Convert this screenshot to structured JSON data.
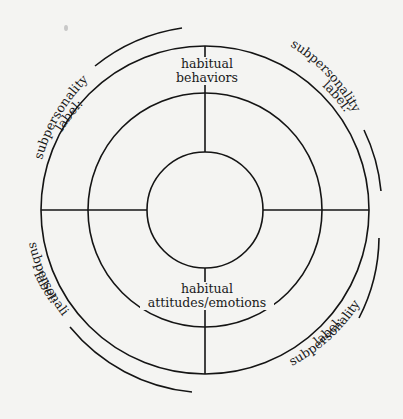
{
  "diagram": {
    "type": "concentric-circle subpersonality worksheet",
    "center": {
      "x": 205,
      "y": 210
    },
    "rings": {
      "outer_radius": 164,
      "middle_radius": 117,
      "inner_radius": 58
    },
    "stroke_color": "#141414",
    "background_color": "#f4f4f2",
    "center_labels": {
      "top": {
        "line1": "habitual",
        "line2": "behaviors"
      },
      "bottom": {
        "line1": "habitual",
        "line2": "attitudes/emotions"
      }
    },
    "quadrant_labels": [
      {
        "position": "upper-left",
        "line1": "subpersonality",
        "line2": "label:"
      },
      {
        "position": "upper-right",
        "line1": "subpersonality",
        "line2": "label:"
      },
      {
        "position": "lower-left",
        "line1": "subpersonality",
        "line2": "label:"
      },
      {
        "position": "lower-right",
        "line1": "subpersonality",
        "line2": "label:"
      }
    ]
  }
}
